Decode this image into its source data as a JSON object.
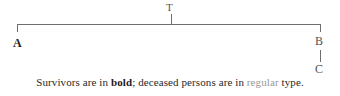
{
  "diagram": {
    "type": "kinship-bracket",
    "top_node": {
      "id": "T",
      "label": "T"
    },
    "left_node": {
      "id": "A",
      "label": "A",
      "style": "bold"
    },
    "right_node": {
      "id": "B",
      "label": "B",
      "style": "regular"
    },
    "right_child_node": {
      "id": "C",
      "label": "C",
      "style": "regular"
    },
    "colors": {
      "line": "#6e6e6e",
      "bold_text": "#1d1b1a",
      "regular_text": "#9b9895",
      "label_text": "#33312f",
      "background": "#ffffff"
    }
  },
  "caption": {
    "part1": "Survivors are in ",
    "bold_word": "bold",
    "part2": "; deceased persons are in ",
    "regular_word": "regular",
    "part3": " type.",
    "full_text": "Survivors are in bold; deceased persons are in regular type."
  }
}
